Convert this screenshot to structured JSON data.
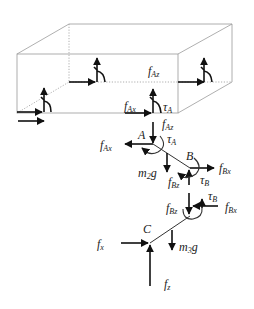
{
  "figure": {
    "type": "free-body diagram"
  },
  "labels": {
    "box_fAz": {
      "base": "f",
      "sub": "Az"
    },
    "box_fAx": {
      "base": "f",
      "sub": "Ax"
    },
    "box_tauA": {
      "base": "τ",
      "sub": "A"
    },
    "link_fAz": {
      "base": "f",
      "sub": "Az"
    },
    "link_fAx": {
      "base": "f",
      "sub": "Ax"
    },
    "link_tauA": {
      "base": "τ",
      "sub": "A"
    },
    "joint_A": "A",
    "joint_B": "B",
    "link_m2g": {
      "base": "m",
      "sub": "2",
      "tail": "g"
    },
    "link_fBz": {
      "base": "f",
      "sub": "Bz"
    },
    "link_fBx": {
      "base": "f",
      "sub": "Bx"
    },
    "link_tauB": {
      "base": "τ",
      "sub": "B"
    },
    "lower_fBz": {
      "base": "f",
      "sub": "Bz"
    },
    "lower_tauB": {
      "base": "τ",
      "sub": "B"
    },
    "lower_fBx": {
      "base": "f",
      "sub": "Bx"
    },
    "joint_C": "C",
    "lower_m3g": {
      "base": "m",
      "sub": "3",
      "tail": "g"
    },
    "foot_fx": {
      "base": "f",
      "sub": "x"
    },
    "foot_fz": {
      "base": "f",
      "sub": "z"
    }
  },
  "colors": {
    "box_edge": "#9a9a9a",
    "arrow": "#111111",
    "text": "#222222",
    "background": "#ffffff"
  }
}
